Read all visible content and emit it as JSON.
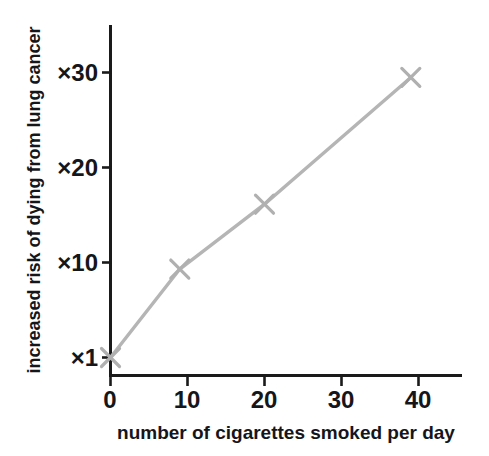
{
  "chart_data": {
    "type": "line",
    "title": "",
    "subtitle": "",
    "xlabel": "number of cigarettes smoked per day",
    "ylabel": "increased risk of dying from lung cancer",
    "x": [
      0,
      9,
      20,
      39
    ],
    "values": [
      1,
      10,
      16.6,
      29.5
    ],
    "series": [
      {
        "name": "increased risk of dying from lung cancer",
        "x": [
          0,
          9,
          20,
          39
        ],
        "values": [
          1,
          10,
          16.6,
          29.5
        ]
      }
    ],
    "xlim": [
      0,
      45.5
    ],
    "ylim": [
      1,
      37
    ],
    "xticks": [
      0,
      10,
      20,
      30,
      40
    ],
    "xtick_labels": [
      "0",
      "10",
      "20",
      "30",
      "40"
    ],
    "yticks": [
      1,
      10,
      20,
      30
    ],
    "ytick_labels": [
      "×1",
      "×10",
      "×20",
      "×30"
    ],
    "grid": false,
    "legend": false,
    "legend_position": "none",
    "marker": "x",
    "annotations": []
  },
  "style": {
    "line_color": "#b5b5b5",
    "marker_color": "#b0b0b0",
    "axis_color": "#1a1a1a",
    "text_color": "#15161a",
    "background": "#ffffff"
  },
  "axes": {
    "x_caption": "number of cigarettes smoked per day",
    "y_caption": "increased risk of dying from lung cancer",
    "x_tick_labels": [
      "0",
      "10",
      "20",
      "30",
      "40"
    ],
    "y_tick_labels": [
      "×30",
      "×20",
      "×10",
      "×1"
    ]
  }
}
